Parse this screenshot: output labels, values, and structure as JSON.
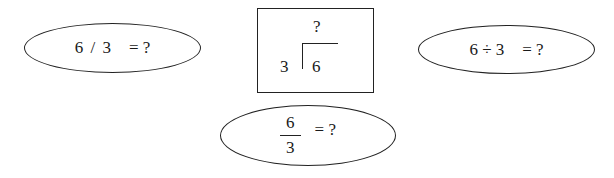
{
  "diagram": {
    "slash_notation": {
      "expression": "6 / 3",
      "equals": "= ?"
    },
    "long_division": {
      "quotient": "?",
      "divisor": "3",
      "dividend": "6"
    },
    "obelus_notation": {
      "expression": "6 ÷ 3",
      "equals": "= ?"
    },
    "fraction_notation": {
      "numerator": "6",
      "denominator": "3",
      "equals": "= ?"
    }
  }
}
